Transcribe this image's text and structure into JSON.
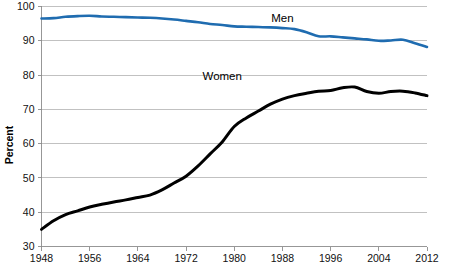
{
  "chart_data": {
    "type": "line",
    "title": "",
    "subtitle": "",
    "xlabel": "",
    "ylabel": "Percent",
    "xlim": [
      1948,
      2012
    ],
    "ylim": [
      30,
      100
    ],
    "y_ticks": [
      30,
      40,
      50,
      60,
      70,
      80,
      90,
      100
    ],
    "x_ticks": [
      1948,
      1956,
      1964,
      1972,
      1980,
      1988,
      1996,
      2004,
      2012
    ],
    "grid": "horizontal",
    "legend_position": "inline-annotation",
    "annotations": [
      {
        "text": "Men",
        "x": 1988,
        "y": 95.5
      },
      {
        "text": "Women",
        "x": 1978,
        "y": 78.5
      }
    ],
    "x": [
      1948,
      1950,
      1952,
      1954,
      1956,
      1958,
      1960,
      1962,
      1964,
      1966,
      1968,
      1970,
      1972,
      1974,
      1976,
      1978,
      1980,
      1982,
      1984,
      1986,
      1988,
      1990,
      1992,
      1994,
      1996,
      1998,
      2000,
      2002,
      2004,
      2006,
      2008,
      2010,
      2012
    ],
    "series": [
      {
        "name": "Men",
        "color": "#1F6CB0",
        "values": [
          96.5,
          96.6,
          97.0,
          97.2,
          97.3,
          97.1,
          97.0,
          96.9,
          96.8,
          96.7,
          96.5,
          96.2,
          95.8,
          95.4,
          94.9,
          94.6,
          94.2,
          94.1,
          94.0,
          93.9,
          93.7,
          93.4,
          92.5,
          91.3,
          91.3,
          91.0,
          90.7,
          90.4,
          90.0,
          90.1,
          90.3,
          89.3,
          88.2
        ]
      },
      {
        "name": "Women",
        "color": "#000000",
        "values": [
          35.0,
          37.5,
          39.3,
          40.4,
          41.5,
          42.3,
          43.0,
          43.6,
          44.3,
          45.0,
          46.5,
          48.5,
          50.5,
          53.5,
          57.0,
          60.5,
          65.0,
          67.5,
          69.5,
          71.5,
          73.0,
          74.0,
          74.7,
          75.3,
          75.5,
          76.3,
          76.5,
          75.2,
          74.7,
          75.2,
          75.3,
          74.8,
          74.0
        ]
      }
    ]
  },
  "axis": {
    "y_title": "Percent",
    "y_tick_labels": [
      "30",
      "40",
      "50",
      "60",
      "70",
      "80",
      "90",
      "100"
    ],
    "x_tick_labels": [
      "1948",
      "1956",
      "1964",
      "1972",
      "1980",
      "1988",
      "1996",
      "2004",
      "2012"
    ]
  },
  "labels": {
    "men": "Men",
    "women": "Women"
  },
  "colors": {
    "men_line": "#1F6CB0",
    "women_line": "#000000",
    "gridline": "#a6a6a6",
    "axis": "#8c8c8c",
    "background": "#ffffff"
  }
}
